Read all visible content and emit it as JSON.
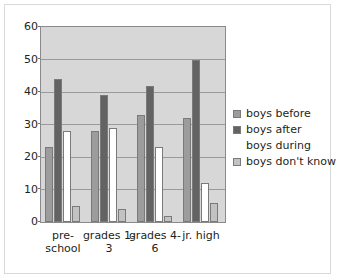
{
  "chart_data": {
    "type": "bar",
    "title": "",
    "subtitle": "",
    "xlabel": "",
    "ylabel": "",
    "ylim": [
      0,
      60
    ],
    "ytick_values": [
      0,
      10,
      20,
      30,
      40,
      50,
      60
    ],
    "ytick_labels": [
      "0",
      "10",
      "20",
      "30",
      "40",
      "50",
      "60"
    ],
    "grid": true,
    "legend_position": "right",
    "categories": [
      "pre-school",
      "grades 1-3",
      "grades 4-6",
      "jr. high"
    ],
    "category_display": [
      "pre-\nschool",
      "grades 1-\n3",
      "grades 4-\n6",
      "jr. high"
    ],
    "series": [
      {
        "name": "boys before",
        "color": "#9c9c9c",
        "values": [
          23,
          28,
          33,
          32
        ]
      },
      {
        "name": "boys after",
        "color": "#636363",
        "values": [
          44,
          39,
          42,
          50
        ]
      },
      {
        "name": "boys during",
        "color": "#ffffff",
        "values": [
          28,
          29,
          23,
          12
        ]
      },
      {
        "name": "boys don't know",
        "color": "#c2c2c2",
        "values": [
          5,
          4,
          2,
          6
        ]
      }
    ],
    "plot_background": "#d7d7d7",
    "gridline_color": "#9a9a9a",
    "axis_color": "#8a8a8a"
  }
}
